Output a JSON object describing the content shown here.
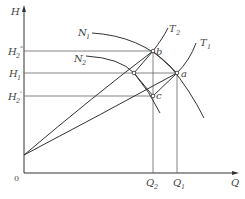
{
  "diagram": {
    "type": "pump-performance-curves",
    "axes": {
      "y_label": "H",
      "x_label": "Q",
      "origin_label": "0"
    },
    "y_ticks": [
      {
        "label": "H",
        "sub": "2",
        "sup": "\"",
        "y": 51
      },
      {
        "label": "H",
        "sub": "1",
        "sup": "",
        "y": 73
      },
      {
        "label": "H",
        "sub": "2",
        "sup": "'",
        "y": 96
      }
    ],
    "x_ticks": [
      {
        "label": "Q",
        "sub": "2",
        "x": 153
      },
      {
        "label": "Q",
        "sub": "1",
        "x": 177
      }
    ],
    "curves": {
      "N1": {
        "label": "N",
        "sub": "1"
      },
      "N2": {
        "label": "N",
        "sub": "2"
      },
      "T1": {
        "label": "T",
        "sub": "1"
      },
      "T2": {
        "label": "T",
        "sub": "2"
      }
    },
    "points": {
      "a": "a",
      "b": "b",
      "c": "c"
    },
    "colors": {
      "line": "#333333",
      "text": "#444444",
      "guide": "#666666"
    }
  }
}
